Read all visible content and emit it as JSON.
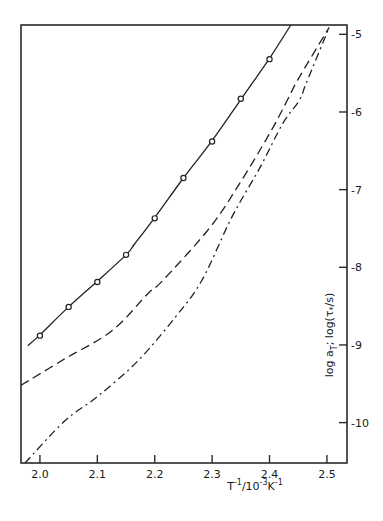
{
  "chart_data": {
    "type": "line",
    "title": "",
    "xlabel": "T^-1/10^-3 K^-1",
    "ylabel": "log a_T;  log(τ*/s)",
    "xlim": [
      1.967,
      2.535
    ],
    "ylim": [
      -10.52,
      -4.88
    ],
    "x_ticks": [
      2.0,
      2.1,
      2.2,
      2.3,
      2.4,
      2.5
    ],
    "x_tick_labels": [
      "2.0",
      "2.1",
      "2.2",
      "2.3",
      "2.4",
      "2.5"
    ],
    "y_ticks": [
      -5,
      -6,
      -7,
      -8,
      -9,
      -10
    ],
    "y_tick_labels": [
      "-5",
      "-6",
      "-7",
      "-8",
      "-9",
      "-10"
    ],
    "y_axis_position": "right",
    "grid": false,
    "legend": null,
    "series": [
      {
        "name": "log a_T (measured points)",
        "style": "markers",
        "marker": "open-circle",
        "x": [
          2.0,
          2.05,
          2.1,
          2.15,
          2.2,
          2.25,
          2.3,
          2.35,
          2.4
        ],
        "y": [
          -8.88,
          -8.51,
          -8.19,
          -7.84,
          -7.37,
          -6.85,
          -6.38,
          -5.83,
          -5.32
        ]
      },
      {
        "name": "fit (solid)",
        "style": "solid",
        "x": [
          1.979,
          2.0,
          2.05,
          2.1,
          2.15,
          2.165,
          2.2,
          2.25,
          2.3,
          2.35,
          2.4,
          2.437
        ],
        "y": [
          -9.01,
          -8.87,
          -8.51,
          -8.18,
          -7.84,
          -7.7,
          -7.36,
          -6.85,
          -6.37,
          -5.84,
          -5.31,
          -4.88
        ]
      },
      {
        "name": "dashed curve",
        "style": "dashed",
        "x": [
          1.967,
          2.043,
          2.125,
          2.188,
          2.214,
          2.296,
          2.348,
          2.4,
          2.431,
          2.449,
          2.504
        ],
        "y": [
          -9.52,
          -9.18,
          -8.82,
          -8.34,
          -8.17,
          -7.49,
          -6.92,
          -6.28,
          -5.85,
          -5.59,
          -4.91
        ]
      },
      {
        "name": "dash-dot curve",
        "style": "dash-dot",
        "x": [
          1.974,
          2.043,
          2.101,
          2.17,
          2.235,
          2.282,
          2.334,
          2.383,
          2.423,
          2.452,
          2.464,
          2.504
        ],
        "y": [
          -10.52,
          -9.98,
          -9.66,
          -9.21,
          -8.65,
          -8.17,
          -7.36,
          -6.72,
          -6.15,
          -5.85,
          -5.63,
          -4.91
        ]
      }
    ]
  },
  "labels": {
    "x_axis": "T⁻¹/10⁻³K⁻¹",
    "y_axis": "log a_T;  log(τ*/s)"
  }
}
